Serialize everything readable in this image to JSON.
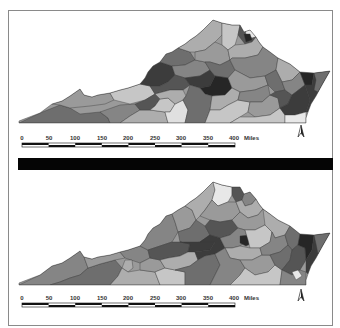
{
  "figure": {
    "colors": {
      "frame_border": "#8a8a8a",
      "separator": "#050505",
      "shades": [
        "#e8e8e8",
        "#c6c6c6",
        "#adadad",
        "#9a9a9a",
        "#858585",
        "#6e6e6e",
        "#555555",
        "#3c3c3c",
        "#262626"
      ]
    }
  },
  "maps": [
    {
      "id": "top",
      "scale_bar": {
        "ticks": [
          "0",
          "50",
          "100",
          "150",
          "200",
          "250",
          "300",
          "350",
          "400"
        ],
        "unit": "Miles"
      },
      "north_arrow": "north-arrow"
    },
    {
      "id": "bottom",
      "scale_bar": {
        "ticks": [
          "0",
          "50",
          "100",
          "150",
          "200",
          "250",
          "300",
          "350",
          "400"
        ],
        "unit": "Miles"
      },
      "north_arrow": "north-arrow"
    }
  ]
}
